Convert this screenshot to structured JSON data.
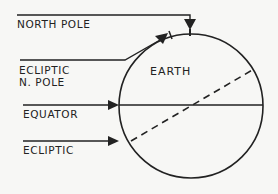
{
  "diagram": {
    "body_label": "EARTH",
    "labels": {
      "north_pole": "NORTH POLE",
      "ecliptic_pole_line1": "ECLIPTIC",
      "ecliptic_pole_line2": "N. POLE",
      "equator": "EQUATOR",
      "ecliptic": "ECLIPTIC"
    },
    "colors": {
      "ink": "#222222",
      "background": "#f7f7f5"
    }
  }
}
